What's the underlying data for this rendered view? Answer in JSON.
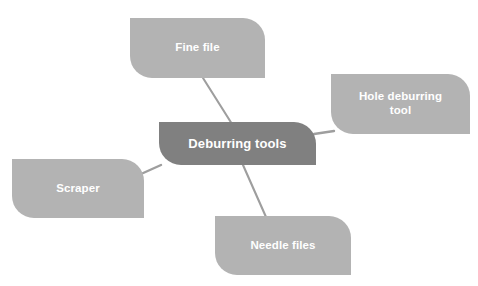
{
  "diagram": {
    "type": "mind-map",
    "title": "Deburring tools",
    "background_color": "#ffffff",
    "center": {
      "label": "Deburring tools",
      "fill_color": "#808080",
      "text_color": "#ffffff"
    },
    "branch_style": {
      "fill_color": "#b3b3b3",
      "text_color": "#ffffff",
      "connector_color": "#9e9e9e"
    },
    "branches": [
      {
        "id": "fine-file",
        "label": "Fine file",
        "position": "top"
      },
      {
        "id": "hole-deburring",
        "label": "Hole deburring\ntool",
        "position": "right"
      },
      {
        "id": "scraper",
        "label": "Scraper",
        "position": "left"
      },
      {
        "id": "needle-files",
        "label": "Needle files",
        "position": "bottom"
      }
    ]
  }
}
